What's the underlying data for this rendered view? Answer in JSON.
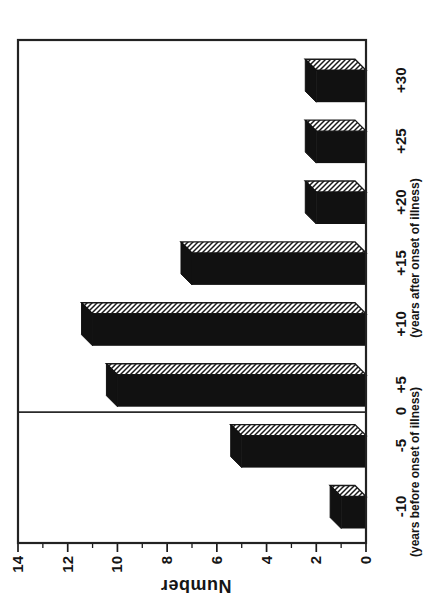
{
  "figure": {
    "background": "#ffffff",
    "ink": "#1a1a1a"
  },
  "chart_data": {
    "type": "bar",
    "title": "",
    "ylabel": "Number",
    "ylim": [
      0,
      14
    ],
    "yticks": [
      0,
      2,
      4,
      6,
      8,
      10,
      12,
      14
    ],
    "minor_tick_step": 1,
    "grid": false,
    "legend": null,
    "categories": [
      "-10",
      "-5",
      "+5",
      "+10",
      "+15",
      "+20",
      "+25",
      "+30"
    ],
    "values": [
      1,
      5,
      10,
      11,
      7,
      2,
      2,
      2
    ],
    "zero_divider": {
      "label": "0",
      "between": [
        "-5",
        "+5"
      ]
    },
    "x_sublabels": {
      "before": "(years before onset of illness)",
      "after": "(years after onset of illness)"
    },
    "bar_style": {
      "front_color": "#111111",
      "top_color": "#111111",
      "side_fill": "diagonal-hatch",
      "hatch_color": "#1a1a1a"
    }
  }
}
